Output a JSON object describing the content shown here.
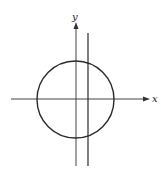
{
  "diagram": {
    "type": "coordinate-plot",
    "axes": {
      "x_label": "x",
      "y_label": "y",
      "origin_px": [
        76,
        99
      ]
    },
    "circle": {
      "center_px": [
        75.5,
        99.5
      ],
      "radius_px": 38.5
    },
    "vertical_line": {
      "x_px": 88,
      "y_top_px": 33,
      "y_bottom_px": 166
    },
    "colors": {
      "stroke": "#2a2a2a",
      "axis": "#444444",
      "background": "#ffffff"
    }
  }
}
